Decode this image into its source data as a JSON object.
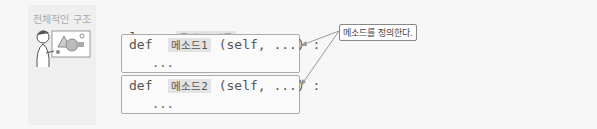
{
  "side": {
    "title": "전체적인 구조",
    "illustration": "person-with-shapes-board"
  },
  "code": {
    "class_kw": "class",
    "class_name": "클래스 이름",
    "colon": ":",
    "methods": [
      {
        "def": "def",
        "name": "메소드1",
        "args": "(self, ...) :",
        "body": "..."
      },
      {
        "def": "def",
        "name": "메소드2",
        "args": "(self, ...) :",
        "body": "..."
      }
    ]
  },
  "annotation": {
    "label": "메소드를 정의한다."
  }
}
